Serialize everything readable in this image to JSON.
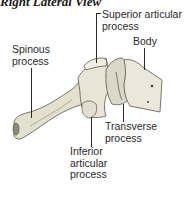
{
  "title": "Right Lateral View",
  "labels": {
    "superior_articular": "Superior articular\nprocess",
    "body": "Body",
    "spinous": "Spinous\nprocess",
    "transverse": "Transverse\nprocess",
    "inferior_articular": "Inferior\narticular\nprocess"
  },
  "colors": {
    "bone_fill": "#e6e2d4",
    "bone_shadow": "#a9a493",
    "outline": "#5a5648",
    "text": "#2a2a2a"
  }
}
